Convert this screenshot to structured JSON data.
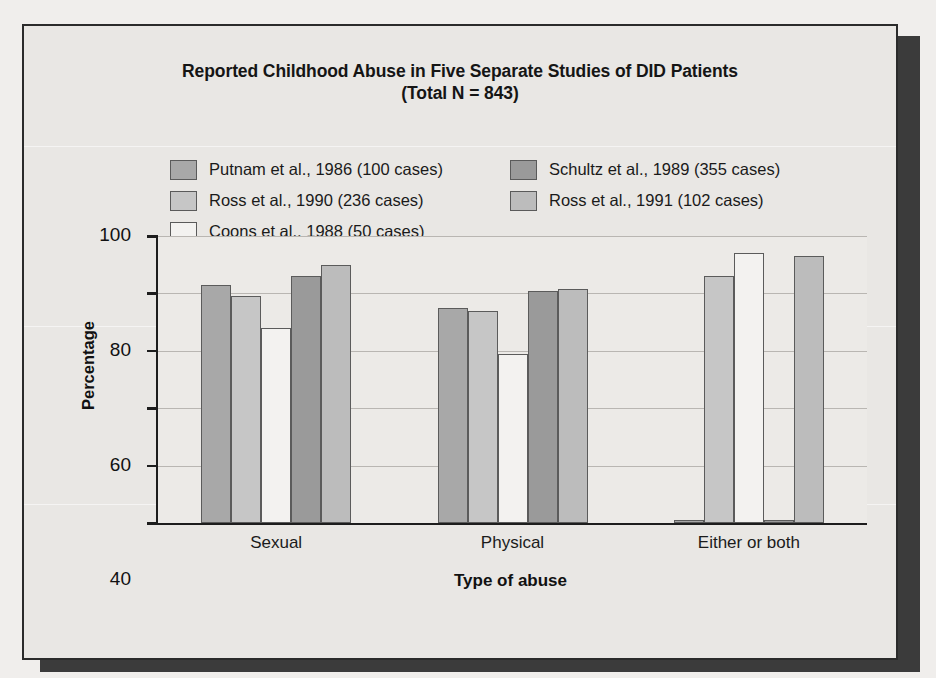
{
  "figure": {
    "title_line1": "Reported Childhood Abuse in Five Separate Studies of DID Patients",
    "title_line2": "(Total N = 843)"
  },
  "legend": {
    "items": [
      {
        "label": "Putnam et al., 1986 (100 cases)",
        "color": "#a8a8a8"
      },
      {
        "label": "Schultz et al., 1989 (355 cases)",
        "color": "#9a9a9a"
      },
      {
        "label": "Ross et al., 1990 (236 cases)",
        "color": "#c6c6c6"
      },
      {
        "label": "Ross et al., 1991 (102 cases)",
        "color": "#bcbcbc"
      },
      {
        "label": "Coons et al., 1988 (50 cases)",
        "color": "#f3f2f0"
      }
    ]
  },
  "axes": {
    "y_title": "Percentage",
    "x_title": "Type of abuse",
    "y_ticks": [
      0,
      20,
      40,
      60,
      80,
      100
    ]
  },
  "chart_data": {
    "type": "bar",
    "title": "Reported Childhood Abuse in Five Separate Studies of DID Patients (Total N = 843)",
    "xlabel": "Type of abuse",
    "ylabel": "Percentage",
    "ylim": [
      0,
      100
    ],
    "yticks": [
      0,
      20,
      40,
      60,
      80,
      100
    ],
    "grid": true,
    "legend_position": "above-plot",
    "categories": [
      "Sexual",
      "Physical",
      "Either or both"
    ],
    "series": [
      {
        "name": "Putnam et al., 1986 (100 cases)",
        "color": "#a8a8a8",
        "values": [
          83,
          75,
          0
        ]
      },
      {
        "name": "Ross et al., 1990 (236 cases)",
        "color": "#c6c6c6",
        "values": [
          79,
          74,
          86
        ]
      },
      {
        "name": "Coons et al., 1988 (50 cases)",
        "color": "#f3f2f0",
        "values": [
          68,
          59,
          94
        ]
      },
      {
        "name": "Schultz et al., 1989 (355 cases)",
        "color": "#9a9a9a",
        "values": [
          86,
          81,
          0
        ]
      },
      {
        "name": "Ross et al., 1991 (102 cases)",
        "color": "#bcbcbc",
        "values": [
          90,
          81.5,
          93
        ]
      }
    ]
  }
}
